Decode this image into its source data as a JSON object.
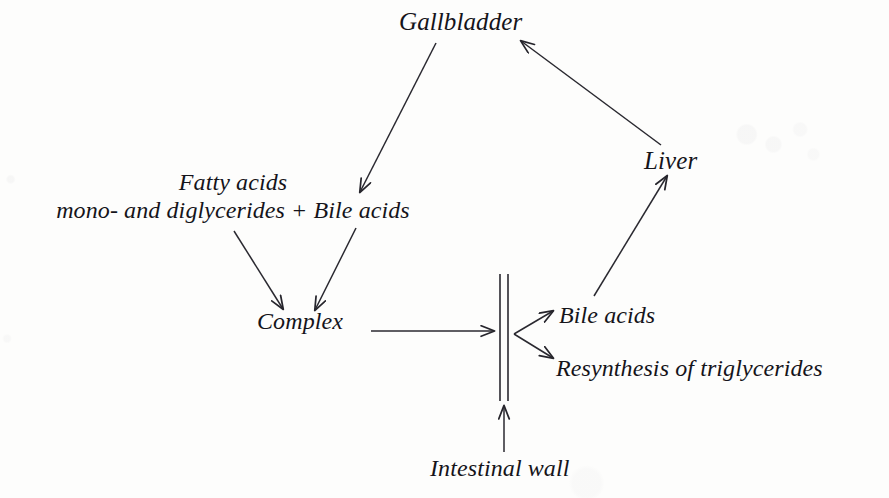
{
  "diagram": {
    "background_color": "#fdfdfc",
    "ink_color": "#1a191f",
    "nodes": {
      "gallbladder": {
        "label": "Gallbladder"
      },
      "liver": {
        "label": "Liver"
      },
      "substrates": {
        "line1": "Fatty acids",
        "line2": "mono- and diglycerides + Bile acids"
      },
      "complex": {
        "label": "Complex"
      },
      "bile_acids": {
        "label": "Bile acids"
      },
      "resynthesis": {
        "label": "Resynthesis of triglycerides"
      },
      "intestinal_wall": {
        "label": "Intestinal wall"
      }
    },
    "barrier": {
      "name": "intestinal-wall-barrier",
      "description": "double vertical line"
    },
    "edges": [
      {
        "name": "gallbladder-to-bile-acids",
        "from": "Gallbladder",
        "to": "Bile acids (substrate line)"
      },
      {
        "name": "liver-to-gallbladder",
        "from": "Liver",
        "to": "Gallbladder"
      },
      {
        "name": "fatty-acids-to-complex",
        "from": "Fatty acids / mono- and diglycerides",
        "to": "Complex"
      },
      {
        "name": "bile-acids-to-complex",
        "from": "Bile acids",
        "to": "Complex"
      },
      {
        "name": "complex-to-wall",
        "from": "Complex",
        "to": "Intestinal wall"
      },
      {
        "name": "wall-to-bile-acids",
        "from": "Intestinal wall",
        "to": "Bile acids"
      },
      {
        "name": "wall-to-resynthesis",
        "from": "Intestinal wall",
        "to": "Resynthesis of triglycerides"
      },
      {
        "name": "bile-acids-to-liver",
        "from": "Bile acids",
        "to": "Liver"
      },
      {
        "name": "intestinal-wall-label-to-barrier",
        "from": "Intestinal wall",
        "to": "barrier"
      }
    ]
  }
}
